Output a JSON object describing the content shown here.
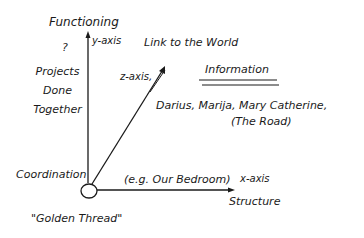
{
  "diagram": {
    "axes": {
      "y": {
        "label": "y-axis",
        "title": "Functioning"
      },
      "x": {
        "label": "x-axis",
        "title": "Structure"
      },
      "z": {
        "label": "z-axis,",
        "title": "Link to the World"
      }
    },
    "origin": {
      "label": "Coordination",
      "caption": "\"Golden Thread\""
    },
    "y_side": {
      "question": "?",
      "lines": [
        "Projects",
        "Done",
        "Together"
      ]
    },
    "x_example": "(e.g. Our Bedroom)",
    "z_block": {
      "heading": "Information",
      "names": "Darius, Marija, Mary Catherine,",
      "extra": "(The Road)"
    },
    "colors": {
      "ink": "#1a1a1a",
      "background": "#ffffff"
    }
  }
}
